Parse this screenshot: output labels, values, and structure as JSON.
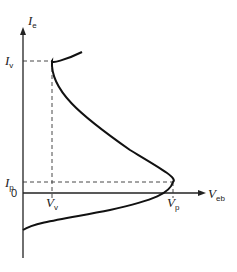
{
  "diagram": {
    "y_axis": {
      "label": "I",
      "sub": "e"
    },
    "x_axis": {
      "label": "V",
      "sub": "eb"
    },
    "origin": "0",
    "valley_current": {
      "label": "I",
      "sub": "v"
    },
    "valley_voltage": {
      "label": "V",
      "sub": "v"
    },
    "peak_current": {
      "label": "I",
      "sub": "p"
    },
    "peak_voltage": {
      "label": "V",
      "sub": "p"
    },
    "colors": {
      "line": "#111111",
      "dash": "#333333"
    }
  }
}
